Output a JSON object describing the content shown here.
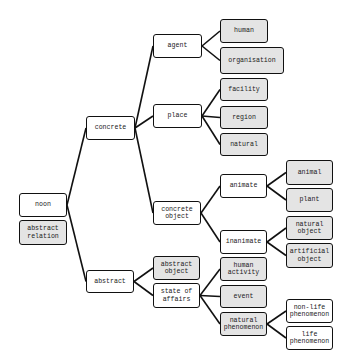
{
  "diagram": {
    "colors": {
      "box_border": "#111111",
      "leaf_fill": "#e4e4e4",
      "inner_fill": "#ffffff",
      "edge": "#111111"
    },
    "nodes": [
      {
        "id": "noon",
        "label": "noon",
        "x": 19,
        "y": 193,
        "w": 48,
        "h": 24,
        "leaf": false
      },
      {
        "id": "abstract_relation",
        "label": "abstract\nrelation",
        "x": 19,
        "y": 220,
        "w": 48,
        "h": 25,
        "leaf": true
      },
      {
        "id": "concrete",
        "label": "concrete",
        "x": 86,
        "y": 116,
        "w": 49,
        "h": 24,
        "leaf": false
      },
      {
        "id": "abstract",
        "label": "abstract",
        "x": 86,
        "y": 270,
        "w": 48,
        "h": 23,
        "leaf": false
      },
      {
        "id": "agent",
        "label": "agent",
        "x": 153,
        "y": 34,
        "w": 49,
        "h": 24,
        "leaf": false
      },
      {
        "id": "place",
        "label": "place",
        "x": 153,
        "y": 104,
        "w": 49,
        "h": 24,
        "leaf": false
      },
      {
        "id": "concrete_object",
        "label": "concrete\nobject",
        "x": 153,
        "y": 201,
        "w": 48,
        "h": 24,
        "leaf": false
      },
      {
        "id": "abstract_object",
        "label": "abstract\nobject",
        "x": 153,
        "y": 256,
        "w": 47,
        "h": 24,
        "leaf": true
      },
      {
        "id": "state_of_affairs",
        "label": "state of\naffairs",
        "x": 153,
        "y": 283,
        "w": 47,
        "h": 25,
        "leaf": false
      },
      {
        "id": "human",
        "label": "human",
        "x": 220,
        "y": 19,
        "w": 48,
        "h": 24,
        "leaf": true
      },
      {
        "id": "organisation",
        "label": "organisation",
        "x": 220,
        "y": 47,
        "w": 64,
        "h": 27,
        "leaf": true
      },
      {
        "id": "facility",
        "label": "facility",
        "x": 220,
        "y": 78,
        "w": 48,
        "h": 23,
        "leaf": true
      },
      {
        "id": "region",
        "label": "region",
        "x": 220,
        "y": 106,
        "w": 48,
        "h": 23,
        "leaf": true
      },
      {
        "id": "natural",
        "label": "natural",
        "x": 220,
        "y": 133,
        "w": 48,
        "h": 23,
        "leaf": true
      },
      {
        "id": "animate",
        "label": "animate",
        "x": 220,
        "y": 174,
        "w": 47,
        "h": 24,
        "leaf": false
      },
      {
        "id": "inanimate",
        "label": "inanimate",
        "x": 220,
        "y": 230,
        "w": 47,
        "h": 24,
        "leaf": false
      },
      {
        "id": "human_activity",
        "label": "human\nactivity",
        "x": 220,
        "y": 257,
        "w": 47,
        "h": 24,
        "leaf": true
      },
      {
        "id": "event",
        "label": "event",
        "x": 220,
        "y": 285,
        "w": 47,
        "h": 23,
        "leaf": true
      },
      {
        "id": "natural_phenomenon",
        "label": "natural\nphenomenon",
        "x": 220,
        "y": 312,
        "w": 47,
        "h": 24,
        "leaf": true
      },
      {
        "id": "animal",
        "label": "animal",
        "x": 286,
        "y": 160,
        "w": 47,
        "h": 25,
        "leaf": true
      },
      {
        "id": "plant",
        "label": "plant",
        "x": 286,
        "y": 188,
        "w": 47,
        "h": 24,
        "leaf": true
      },
      {
        "id": "natural_object",
        "label": "natural\nobject",
        "x": 286,
        "y": 216,
        "w": 47,
        "h": 24,
        "leaf": true
      },
      {
        "id": "artificial_object",
        "label": "artificial\nobject",
        "x": 286,
        "y": 243,
        "w": 47,
        "h": 25,
        "leaf": true
      },
      {
        "id": "non_life_phenomenon",
        "label": "non-life\nphenomenon",
        "x": 286,
        "y": 299,
        "w": 47,
        "h": 24,
        "leaf": false
      },
      {
        "id": "life_phenomenon",
        "label": "life\nphenomenon",
        "x": 286,
        "y": 326,
        "w": 47,
        "h": 24,
        "leaf": false
      }
    ],
    "edges": [
      [
        "noon",
        "concrete"
      ],
      [
        "noon",
        "abstract"
      ],
      [
        "concrete",
        "agent"
      ],
      [
        "concrete",
        "place"
      ],
      [
        "concrete",
        "concrete_object"
      ],
      [
        "abstract",
        "abstract_object"
      ],
      [
        "abstract",
        "state_of_affairs"
      ],
      [
        "agent",
        "human"
      ],
      [
        "agent",
        "organisation"
      ],
      [
        "place",
        "facility"
      ],
      [
        "place",
        "region"
      ],
      [
        "place",
        "natural"
      ],
      [
        "concrete_object",
        "animate"
      ],
      [
        "concrete_object",
        "inanimate"
      ],
      [
        "animate",
        "animal"
      ],
      [
        "animate",
        "plant"
      ],
      [
        "inanimate",
        "natural_object"
      ],
      [
        "inanimate",
        "artificial_object"
      ],
      [
        "state_of_affairs",
        "human_activity"
      ],
      [
        "state_of_affairs",
        "event"
      ],
      [
        "state_of_affairs",
        "natural_phenomenon"
      ],
      [
        "natural_phenomenon",
        "non_life_phenomenon"
      ],
      [
        "natural_phenomenon",
        "life_phenomenon"
      ]
    ]
  }
}
